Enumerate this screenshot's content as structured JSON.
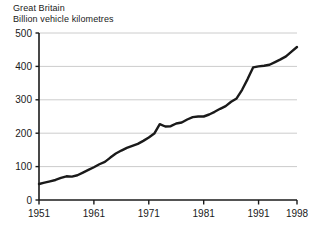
{
  "chart_data": {
    "type": "line",
    "title": "",
    "header_lines": [
      "Great Britain",
      "Billion vehicle kilometres"
    ],
    "xlabel": "",
    "ylabel": "",
    "ylim": [
      0,
      500
    ],
    "xlim": [
      1951,
      1998
    ],
    "yticks": [
      0,
      100,
      200,
      300,
      400,
      500
    ],
    "ytick_labels": [
      "0",
      "100",
      "200",
      "300",
      "400",
      "500"
    ],
    "xticks": [
      1951,
      1961,
      1971,
      1981,
      1991,
      1998
    ],
    "xtick_labels": [
      "1951",
      "1961",
      "1971",
      "1981",
      "1991",
      "1998"
    ],
    "grid": "horizontal",
    "legend": "none",
    "line_color": "#1a1a1a",
    "grid_color": "#cccccc",
    "axis_color": "#1a1a1a",
    "x": [
      1951,
      1952,
      1953,
      1954,
      1955,
      1956,
      1957,
      1958,
      1959,
      1960,
      1961,
      1962,
      1963,
      1964,
      1965,
      1966,
      1967,
      1968,
      1969,
      1970,
      1971,
      1972,
      1973,
      1974,
      1975,
      1976,
      1977,
      1978,
      1979,
      1980,
      1981,
      1982,
      1983,
      1984,
      1985,
      1986,
      1987,
      1988,
      1989,
      1990,
      1991,
      1992,
      1993,
      1994,
      1995,
      1996,
      1997,
      1998
    ],
    "values": [
      48,
      52,
      56,
      60,
      66,
      71,
      70,
      74,
      82,
      90,
      98,
      107,
      114,
      127,
      139,
      148,
      156,
      162,
      168,
      177,
      187,
      199,
      227,
      220,
      221,
      229,
      232,
      241,
      248,
      250,
      250,
      256,
      264,
      273,
      281,
      294,
      304,
      330,
      362,
      397,
      400,
      402,
      405,
      413,
      421,
      430,
      444,
      458
    ]
  }
}
